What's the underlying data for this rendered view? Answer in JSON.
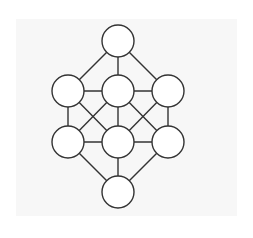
{
  "diagram": {
    "type": "graph",
    "colors": {
      "background": "#ffffff",
      "panel": "#f7f7f7",
      "stroke": "#333333",
      "node_fill": "#ffffff"
    },
    "node_radius": 16,
    "nodes": [
      {
        "id": "n0",
        "label": "",
        "x": 118,
        "y": 41
      },
      {
        "id": "n1",
        "label": "",
        "x": 68,
        "y": 91
      },
      {
        "id": "n2",
        "label": "",
        "x": 118,
        "y": 91
      },
      {
        "id": "n3",
        "label": "",
        "x": 168,
        "y": 91
      },
      {
        "id": "n4",
        "label": "",
        "x": 68,
        "y": 142
      },
      {
        "id": "n5",
        "label": "",
        "x": 118,
        "y": 142
      },
      {
        "id": "n6",
        "label": "",
        "x": 168,
        "y": 142
      },
      {
        "id": "n7",
        "label": "",
        "x": 118,
        "y": 192
      }
    ],
    "edges": [
      [
        "n0",
        "n1"
      ],
      [
        "n0",
        "n2"
      ],
      [
        "n0",
        "n3"
      ],
      [
        "n1",
        "n2"
      ],
      [
        "n2",
        "n3"
      ],
      [
        "n1",
        "n4"
      ],
      [
        "n1",
        "n5"
      ],
      [
        "n2",
        "n4"
      ],
      [
        "n2",
        "n5"
      ],
      [
        "n2",
        "n6"
      ],
      [
        "n3",
        "n5"
      ],
      [
        "n3",
        "n6"
      ],
      [
        "n4",
        "n5"
      ],
      [
        "n5",
        "n6"
      ],
      [
        "n4",
        "n7"
      ],
      [
        "n5",
        "n7"
      ],
      [
        "n6",
        "n7"
      ]
    ]
  }
}
